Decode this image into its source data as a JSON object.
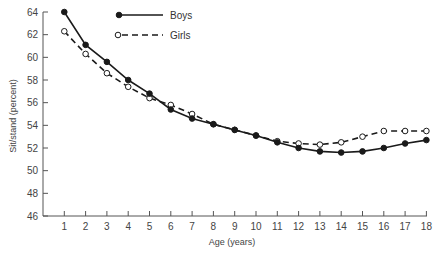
{
  "chart_data": {
    "type": "line",
    "title": "",
    "xlabel": "Age (years)",
    "ylabel": "Sit/stand (percent)",
    "x": [
      1,
      2,
      3,
      4,
      5,
      6,
      7,
      8,
      9,
      10,
      11,
      12,
      13,
      14,
      15,
      16,
      17,
      18
    ],
    "xlim": [
      0,
      18
    ],
    "ylim": [
      46,
      64
    ],
    "x_ticks": [
      "1",
      "2",
      "3",
      "4",
      "5",
      "6",
      "7",
      "8",
      "9",
      "10",
      "11",
      "12",
      "13",
      "14",
      "15",
      "16",
      "17",
      "18"
    ],
    "y_ticks": [
      "46",
      "48",
      "50",
      "52",
      "54",
      "56",
      "58",
      "60",
      "62",
      "64"
    ],
    "grid": false,
    "legend_position": "top-left-inside",
    "series": [
      {
        "name": "Boys",
        "style": "solid",
        "marker": "filled-circle",
        "values": [
          64.0,
          61.1,
          59.6,
          58.0,
          56.8,
          55.4,
          54.6,
          54.1,
          53.6,
          53.1,
          52.5,
          52.0,
          51.7,
          51.6,
          51.7,
          52.0,
          52.4,
          52.7
        ]
      },
      {
        "name": "Girls",
        "style": "dashed",
        "marker": "open-circle",
        "values": [
          62.3,
          60.3,
          58.6,
          57.4,
          56.4,
          55.8,
          55.0,
          54.1,
          53.6,
          53.1,
          52.6,
          52.4,
          52.3,
          52.5,
          53.0,
          53.5,
          53.5,
          53.5
        ]
      }
    ]
  },
  "colors": {
    "line": "#1a1a1a",
    "axis": "#555555",
    "text": "#444444",
    "open_marker_fill": "#ffffff"
  }
}
